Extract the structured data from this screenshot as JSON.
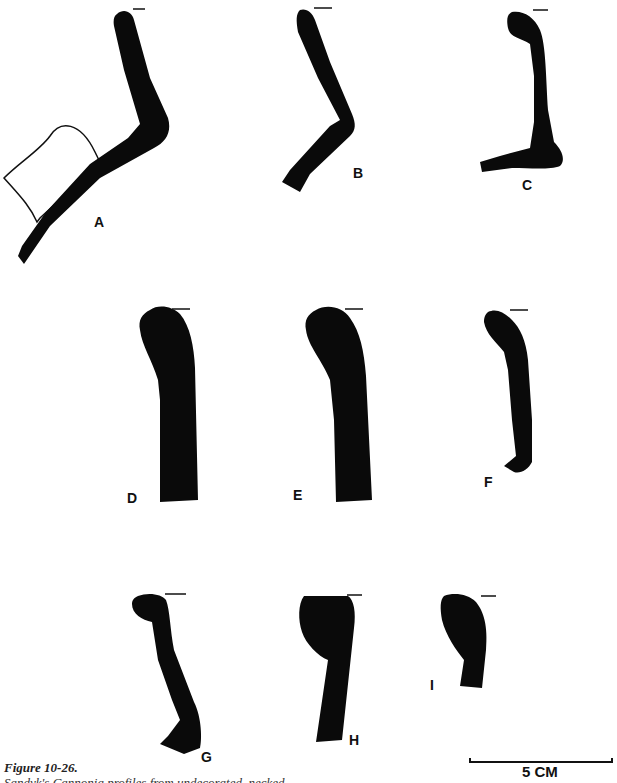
{
  "figure": {
    "title": "Figure 10-26.",
    "caption_partial": "Sandyk's Cannonia profiles from undecorated, necked",
    "scale_bar": {
      "label": "5 CM",
      "length_cm": 5
    },
    "profiles": [
      {
        "id": "A",
        "label": "A"
      },
      {
        "id": "B",
        "label": "B"
      },
      {
        "id": "C",
        "label": "C"
      },
      {
        "id": "D",
        "label": "D"
      },
      {
        "id": "E",
        "label": "E"
      },
      {
        "id": "F",
        "label": "F"
      },
      {
        "id": "G",
        "label": "G"
      },
      {
        "id": "H",
        "label": "H"
      },
      {
        "id": "I",
        "label": "I"
      }
    ],
    "fill_color": "#0a0a0a"
  }
}
